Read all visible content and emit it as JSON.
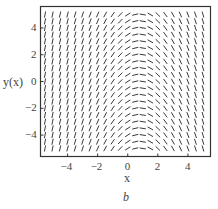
{
  "chart_data": {
    "type": "slope_field",
    "title": "",
    "caption": "b",
    "xlabel": "x",
    "ylabel": "y(x)",
    "xlim": [
      -5.8,
      5.5
    ],
    "ylim": [
      -5.6,
      5.6
    ],
    "x_ticks": [
      -4,
      -2,
      0,
      2,
      4
    ],
    "y_ticks": [
      -4,
      -2,
      0,
      2,
      4
    ],
    "x_tick_labels": [
      "−4",
      "−2",
      "0",
      "2",
      "4"
    ],
    "y_tick_labels": [
      "−4",
      "−2",
      "0",
      "2",
      "4"
    ],
    "grid": false,
    "columns_x": [
      -5.5,
      -5.0,
      -4.5,
      -4.0,
      -3.5,
      -3.0,
      -2.5,
      -2.0,
      -1.5,
      -1.0,
      -0.5,
      0.0,
      0.5,
      1.0,
      1.5,
      2.0,
      2.5,
      3.0,
      3.5,
      4.0,
      4.5,
      5.0
    ],
    "rows_y": [
      5.0,
      4.5,
      4.0,
      3.5,
      3.0,
      2.5,
      2.0,
      1.5,
      1.0,
      0.5,
      0.0,
      -0.5,
      -1.0,
      -1.5,
      -2.0,
      -2.5,
      -3.0,
      -3.5,
      -4.0,
      -4.5,
      -5.0
    ],
    "slope_fn": "dy/dx = 0.9*(0.8 - x)"
  },
  "colors": {
    "segment": "#3a3a3a",
    "axes": "#333333",
    "text": "#444444"
  }
}
